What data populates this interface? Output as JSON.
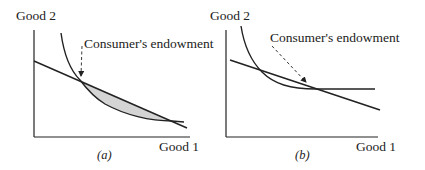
{
  "colors": {
    "ink": "#222222",
    "shade": "#d4d4d4",
    "background": "#ffffff"
  },
  "panels": [
    {
      "id": "a",
      "caption": "(a)",
      "y_axis_label": "Good 2",
      "x_axis_label": "Good 1",
      "annotation": "Consumer's endowment",
      "elements": [
        "indifference-curve",
        "budget-line",
        "shaded-region",
        "endowment-arrow"
      ]
    },
    {
      "id": "b",
      "caption": "(b)",
      "y_axis_label": "Good 2",
      "x_axis_label": "Good 1",
      "annotation": "Consumer's endowment",
      "elements": [
        "indifference-curve-with-flat-segment",
        "budget-line",
        "endowment-arrow"
      ]
    }
  ]
}
